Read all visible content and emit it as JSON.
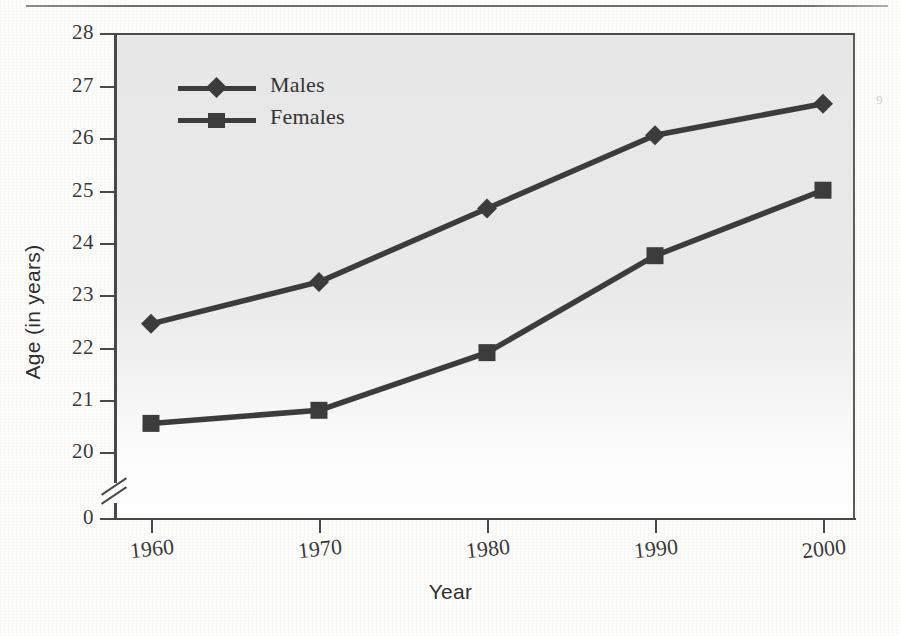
{
  "figure": {
    "y_axis_title": "Age (in years)",
    "x_axis_title": "Year",
    "corner_mark": "9"
  },
  "legend": {
    "position": "inside-top-left",
    "items": [
      {
        "label": "Males",
        "marker": "diamond-marker-icon"
      },
      {
        "label": "Females",
        "marker": "square-marker-icon"
      }
    ]
  },
  "axes": {
    "y_ticks": [
      "28",
      "27",
      "26",
      "25",
      "24",
      "23",
      "22",
      "21",
      "20",
      "0"
    ],
    "x_ticks": [
      "1960",
      "1970",
      "1980",
      "1990",
      "2000"
    ],
    "y_axis_break": true
  },
  "chart_data": {
    "type": "line",
    "title": "",
    "xlabel": "Year",
    "ylabel": "Age (in years)",
    "categories": [
      "1960",
      "1970",
      "1980",
      "1990",
      "2000"
    ],
    "x": [
      1960,
      1970,
      1980,
      1990,
      2000
    ],
    "series": [
      {
        "name": "Males",
        "marker": "diamond",
        "values": [
          22.45,
          23.25,
          24.65,
          26.05,
          26.65
        ]
      },
      {
        "name": "Females",
        "marker": "square",
        "values": [
          20.55,
          20.8,
          21.9,
          23.75,
          25.0
        ]
      }
    ],
    "ylim": [
      20,
      28
    ],
    "y_axis_break_at": 20,
    "y_axis_baseline": 0,
    "ytick_values": [
      20,
      21,
      22,
      23,
      24,
      25,
      26,
      27,
      28
    ],
    "xlim": [
      1960,
      2000
    ],
    "grid": false,
    "legend_position": "upper left",
    "line_color": "#3c3c3c",
    "plot_background": "#e8e8e8"
  }
}
